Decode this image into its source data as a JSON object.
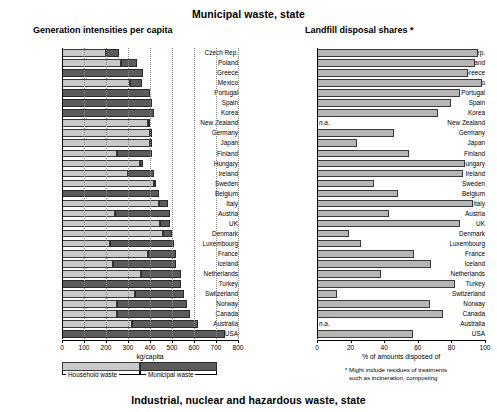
{
  "titles": {
    "main": "Municipal waste, state",
    "bottom": "Industrial, nuclear and hazardous waste, state",
    "left_panel": "Generation intensities per capita",
    "right_panel": "Landfill disposal shares *"
  },
  "legend": {
    "household_label": "Household waste",
    "municipal_label": "Municipal waste",
    "household_color": "#c9c9c9",
    "municipal_color": "#5b5b5b"
  },
  "footnote": {
    "line1": "* Might include residues of treatments",
    "line2": "such as incineration, composting"
  },
  "na_text": "n.a.",
  "chart_data": [
    {
      "type": "bar",
      "id": "generation-intensities",
      "title": "Generation intensities per capita",
      "orientation": "horizontal",
      "stacked": true,
      "xlabel": "kg/capita",
      "ylabel": "",
      "xlim": [
        0,
        800
      ],
      "xticks": [
        0,
        100,
        200,
        300,
        400,
        500,
        600,
        700,
        800
      ],
      "xticklabels": [
        "0",
        "100",
        "200",
        "300",
        "400",
        "500",
        "600",
        "700",
        "800"
      ],
      "grid": true,
      "legend_position": "below",
      "categories": [
        "Czech Rep.",
        "Poland",
        "Greece",
        "Mexico",
        "Portugal",
        "Spain",
        "Korea",
        "New Zealand",
        "Germany",
        "Japan",
        "Finland",
        "Hungary",
        "Ireland",
        "Sweden",
        "Belgium",
        "Italy",
        "Austria",
        "UK",
        "Denmark",
        "Luxembourg",
        "France",
        "Iceland",
        "Netherlands",
        "Turkey",
        "Switzerland",
        "Norway",
        "Canada",
        "Australia",
        "USA"
      ],
      "series": [
        {
          "name": "Household waste",
          "color": "#c9c9c9",
          "values": [
            200,
            270,
            0,
            310,
            0,
            0,
            0,
            390,
            400,
            400,
            250,
            355,
            300,
            420,
            0,
            440,
            240,
            445,
            460,
            220,
            390,
            230,
            360,
            0,
            330,
            250,
            250,
            320,
            0
          ]
        },
        {
          "name": "Municipal waste",
          "color": "#5b5b5b",
          "values": [
            260,
            340,
            370,
            365,
            400,
            410,
            420,
            390,
            400,
            400,
            410,
            370,
            420,
            420,
            440,
            480,
            490,
            490,
            500,
            510,
            520,
            520,
            540,
            540,
            555,
            570,
            580,
            620,
            740
          ]
        }
      ]
    },
    {
      "type": "bar",
      "id": "landfill-disposal-shares",
      "title": "Landfill disposal shares *",
      "orientation": "horizontal",
      "stacked": false,
      "xlabel": "% of amounts disposed of",
      "ylabel": "",
      "xlim": [
        0,
        100
      ],
      "xticks": [
        0,
        20,
        40,
        60,
        80,
        100
      ],
      "xticklabels": [
        "0",
        "20",
        "40",
        "60",
        "80",
        "100"
      ],
      "grid": false,
      "color": "#b6b6b6",
      "categories": [
        "Czech Rep.",
        "Poland",
        "Greece",
        "Mexico",
        "Portugal",
        "Spain",
        "Korea",
        "New Zealand",
        "Germany",
        "Japan",
        "Finland",
        "Hungary",
        "Ireland",
        "Sweden",
        "Belgium",
        "Italy",
        "Austria",
        "UK",
        "Denmark",
        "Luxembourg",
        "France",
        "Iceland",
        "Netherlands",
        "Turkey",
        "Switzerland",
        "Norway",
        "Canada",
        "Australia",
        "USA"
      ],
      "values": [
        96,
        94,
        90,
        98,
        85,
        80,
        72,
        null,
        46,
        24,
        55,
        88,
        87,
        34,
        48,
        93,
        43,
        85,
        19,
        26,
        58,
        68,
        38,
        82,
        12,
        67,
        75,
        null,
        57
      ],
      "na_categories": [
        "New Zealand",
        "Australia"
      ]
    }
  ]
}
